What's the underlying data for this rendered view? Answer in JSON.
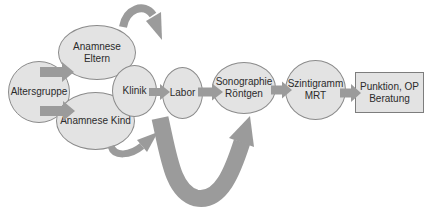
{
  "colors": {
    "bg": "#ffffff",
    "node-fill": "#e3e3e3",
    "node-border": "#8b8b8b",
    "rect-border": "#7d7d7d",
    "arrow": "#9b9b9b",
    "text": "#2b2b2b"
  },
  "nodes": {
    "altersgruppe": {
      "label": "Altersgruppe",
      "shape": "ellipse"
    },
    "anamnese_eltern": {
      "label": "Anamnese Eltern",
      "shape": "ellipse"
    },
    "anamnese_kind": {
      "label": "Anamnese Kind",
      "shape": "ellipse"
    },
    "klinik": {
      "label": "Klinik",
      "shape": "ellipse"
    },
    "labor": {
      "label": "Labor",
      "shape": "ellipse"
    },
    "sonographie": {
      "label": "Sonographie\nRöntgen",
      "shape": "ellipse"
    },
    "szintigramm": {
      "label": "Szintigramm\nMRT",
      "shape": "ellipse"
    },
    "punktion": {
      "label": "Punktion, OP\nBeratung",
      "shape": "rectangle"
    }
  },
  "edges": [
    {
      "from": "altersgruppe",
      "to": "anamnese_eltern",
      "style": "block-arrow"
    },
    {
      "from": "altersgruppe",
      "to": "anamnese_kind",
      "style": "block-arrow"
    },
    {
      "from": "klinik",
      "to": "labor",
      "style": "block-arrow"
    },
    {
      "from": "labor",
      "to": "sonographie",
      "style": "block-arrow"
    },
    {
      "from": "sonographie",
      "to": "szintigramm",
      "style": "block-arrow"
    },
    {
      "from": "szintigramm",
      "to": "punktion",
      "style": "block-arrow"
    },
    {
      "from": "anamnese_eltern",
      "to": "",
      "style": "curved-arrow-exit-top-right"
    },
    {
      "from": "anamnese_kind",
      "to": "",
      "style": "curved-arrow-up-right"
    },
    {
      "from": "klinik",
      "to": "sonographie",
      "style": "large-u-curve-bypass"
    }
  ]
}
